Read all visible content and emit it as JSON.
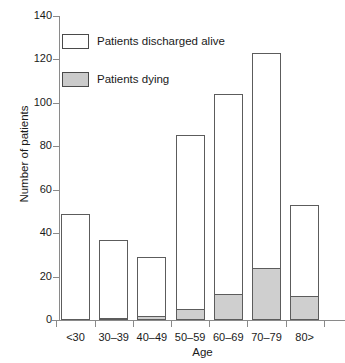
{
  "chart_data": {
    "type": "bar",
    "title": "",
    "subtitle": "",
    "xlabel": "Age",
    "ylabel": "Number of patients",
    "categories": [
      "<30",
      "30–39",
      "40–49",
      "50–59",
      "60–69",
      "70–79",
      "80>"
    ],
    "stacked": true,
    "series": [
      {
        "name": "Patients dying",
        "color": "#cfcfcf",
        "values": [
          0,
          1,
          2,
          5,
          12,
          24,
          11
        ]
      },
      {
        "name": "Patients discharged alive",
        "color": "#ffffff",
        "values": [
          49,
          36,
          27,
          80,
          92,
          99,
          42
        ]
      }
    ],
    "totals": [
      49,
      37,
      29,
      85,
      104,
      123,
      53
    ],
    "ylim": [
      0,
      140
    ],
    "yticks": [
      0,
      20,
      40,
      60,
      80,
      100,
      120,
      140
    ],
    "ytick_labels": [
      "0",
      "20",
      "40",
      "60",
      "80",
      "100",
      "120",
      "140"
    ],
    "grid": false,
    "legend_position": "upper-left",
    "legend": [
      {
        "label": "Patients discharged alive",
        "swatch": "white"
      },
      {
        "label": "Patients dying",
        "swatch": "gray"
      }
    ]
  }
}
